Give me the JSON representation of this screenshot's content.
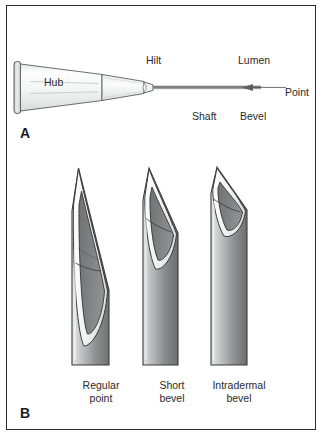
{
  "figure": {
    "border_color": "#2b2b2b",
    "background": "#ffffff"
  },
  "panel_a": {
    "letter": "A",
    "labels": {
      "hub": "Hub",
      "hilt": "Hilt",
      "lumen": "Lumen",
      "point": "Point",
      "shaft": "Shaft",
      "bevel": "Bevel"
    }
  },
  "panel_b": {
    "letter": "B",
    "needles": [
      {
        "caption_line1": "Regular",
        "caption_line2": "point"
      },
      {
        "caption_line1": "Short",
        "caption_line2": "bevel"
      },
      {
        "caption_line1": "Intradermal",
        "caption_line2": "bevel"
      }
    ]
  },
  "colors": {
    "outline": "#3a3a3a",
    "hub_light": "#fbfbfb",
    "hub_shadow": "#d8dad9",
    "shaft_light": "#cfd2d2",
    "shaft_dark": "#7b7f80",
    "lumen_fill": "#7e8081",
    "bevel_rim": "#f7f7f7",
    "text": "#2a2a2a"
  }
}
